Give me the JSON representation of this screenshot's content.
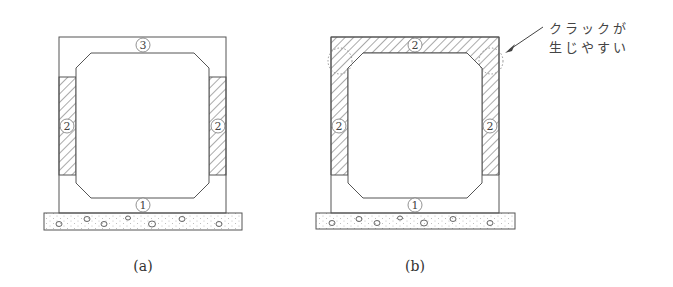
{
  "diagram_a": {
    "caption": "(a)",
    "labels": {
      "top": "3",
      "left": "2",
      "right": "2",
      "bottom": "1"
    },
    "hatched_regions": [
      "left-wall-mid",
      "right-wall-mid"
    ]
  },
  "diagram_b": {
    "caption": "(b)",
    "labels": {
      "top": "2",
      "left": "2",
      "right": "2",
      "bottom": "1"
    },
    "hatched_regions": [
      "top-slab",
      "left-wall-upper",
      "right-wall-upper"
    ],
    "annotation": {
      "line1": "クラックが",
      "line2": "生じやすい"
    }
  },
  "colors": {
    "line": "#555555",
    "hatch": "#555555",
    "dots": "#9a9a9a"
  }
}
